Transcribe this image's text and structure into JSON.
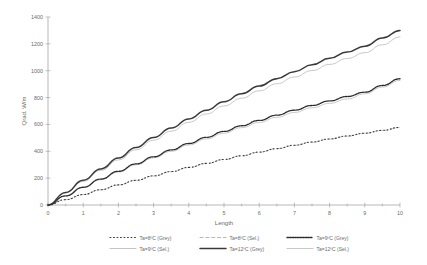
{
  "chart_data": {
    "type": "line",
    "title": "",
    "xlabel": "Length",
    "ylabel": "Qrad. W/m",
    "xlim": [
      0,
      10
    ],
    "ylim": [
      0,
      1400
    ],
    "xticks": [
      "0",
      "1",
      "2",
      "3",
      "4",
      "5",
      "6",
      "7",
      "8",
      "9",
      "10"
    ],
    "yticks": [
      "0",
      "200",
      "400",
      "600",
      "800",
      "1000",
      "1200",
      "1400"
    ],
    "grid": false,
    "legend_position": "bottom",
    "x": [
      0,
      0.5,
      1,
      1.5,
      2,
      2.5,
      3,
      3.5,
      4,
      4.5,
      5,
      5.5,
      6,
      6.5,
      7,
      7.5,
      8,
      8.5,
      9,
      9.5,
      10
    ],
    "series": [
      {
        "name": "Ta=8ºC (Grey)",
        "style": "dotted",
        "color": "#3a3a3a",
        "width": 1.1,
        "values": [
          0,
          40,
          78,
          114,
          150,
          184,
          217,
          249,
          280,
          310,
          339,
          367,
          394,
          420,
          445,
          469,
          492,
          514,
          535,
          556,
          578
        ]
      },
      {
        "name": "Ta=8ºC (Sel.)",
        "style": "dashed",
        "color": "#b0b0b0",
        "width": 0.8,
        "values": [
          0,
          40,
          78,
          114,
          149,
          183,
          216,
          248,
          279,
          309,
          338,
          366,
          393,
          419,
          444,
          468,
          491,
          513,
          534,
          555,
          576
        ]
      },
      {
        "name": "Ta=9ºC (Grey)",
        "style": "dash-dot-dense",
        "color": "#2b2b2b",
        "width": 1.3,
        "values": [
          0,
          68,
          132,
          193,
          251,
          306,
          359,
          410,
          458,
          504,
          548,
          590,
          630,
          669,
          706,
          741,
          775,
          808,
          840,
          890,
          940
        ]
      },
      {
        "name": "Ta=9ºC (Sel.)",
        "style": "solid",
        "color": "#bdbdbd",
        "width": 0.8,
        "values": [
          0,
          66,
          129,
          189,
          245,
          299,
          351,
          400,
          447,
          492,
          535,
          576,
          615,
          653,
          689,
          724,
          757,
          789,
          828,
          878,
          928
        ]
      },
      {
        "name": "Ta=12ºC (Grey)",
        "style": "solid",
        "color": "#3a3a3a",
        "width": 1.5,
        "values": [
          0,
          94,
          184,
          269,
          350,
          428,
          502,
          573,
          641,
          706,
          769,
          828,
          886,
          941,
          993,
          1044,
          1092,
          1139,
          1183,
          1243,
          1300
        ]
      },
      {
        "name": "Ta=12ºC (Sel.)",
        "style": "solid",
        "color": "#c2c2c2",
        "width": 0.9,
        "values": [
          0,
          90,
          176,
          258,
          336,
          411,
          482,
          550,
          616,
          678,
          738,
          795,
          850,
          903,
          953,
          1001,
          1047,
          1091,
          1134,
          1193,
          1252
        ]
      }
    ]
  },
  "legend": {
    "rows": [
      [
        "Ta=8ºC (Grey)",
        "Ta=8ºC (Sel.)",
        "Ta=9ºC (Grey)"
      ],
      [
        "Ta=9ºC (Sel.)",
        "Ta=12ºC (Grey)",
        "Ta=12ºC (Sel.)"
      ]
    ]
  }
}
